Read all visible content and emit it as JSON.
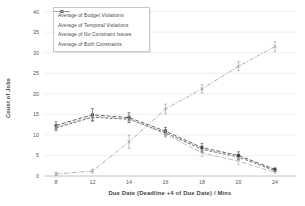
{
  "chart_data": {
    "type": "line",
    "title": "",
    "xlabel": "Due Date (Deadline +4 of Due Date)  /  Mins",
    "ylabel": "Count of Jobs",
    "categories": [
      "8",
      "12",
      "14",
      "16",
      "18",
      "20",
      "24"
    ],
    "ylim": [
      0,
      40
    ],
    "ytick_step": 5,
    "yticks": [
      0,
      5,
      10,
      15,
      20,
      25,
      30,
      35,
      40
    ],
    "grid": "horizontal",
    "legend_position": "top-left-inside",
    "error_bars": true,
    "colors": {
      "grid": "#e4e4e4",
      "axis": "#b3b3b3",
      "tick_text": "#595959",
      "dark_series": "#4d4d4d",
      "light_series": "#a6a6a6"
    },
    "series": [
      {
        "name": "Average of Budget Violations",
        "marker": "x",
        "color": "#4d4d4d",
        "dash": "3,1.6",
        "values": [
          11.7,
          14.3,
          13.8,
          10.5,
          6.5,
          4.6,
          1.3
        ],
        "errors": [
          0.7,
          0.9,
          0.8,
          0.8,
          0.8,
          0.7,
          0.3
        ]
      },
      {
        "name": "Average of Temporal Violations",
        "marker": "square",
        "color": "#3f3f3f",
        "dash": "4,1.8",
        "values": [
          12.3,
          14.9,
          14.2,
          10.9,
          6.9,
          5.0,
          1.6
        ],
        "errors": [
          0.9,
          1.5,
          1.2,
          0.9,
          1.0,
          0.9,
          0.4
        ]
      },
      {
        "name": "Average of No Constraint Issues",
        "marker": "x",
        "color": "#9a9a9a",
        "dash": "4,1.5,1.2,1.5",
        "values": [
          0.5,
          1.2,
          8.3,
          16.3,
          21.2,
          26.7,
          31.5
        ],
        "errors": [
          0.4,
          0.5,
          1.6,
          1.2,
          1.0,
          1.1,
          1.2
        ]
      },
      {
        "name": "Average of Both Constraints",
        "marker": "none",
        "color": "#b0b0b0",
        "dash": "5,2",
        "values": [
          11.9,
          14.5,
          13.9,
          10.2,
          5.6,
          3.6,
          0.9
        ],
        "errors": [
          0.5,
          0.7,
          0.8,
          0.8,
          0.9,
          0.8,
          0.3
        ]
      }
    ]
  }
}
